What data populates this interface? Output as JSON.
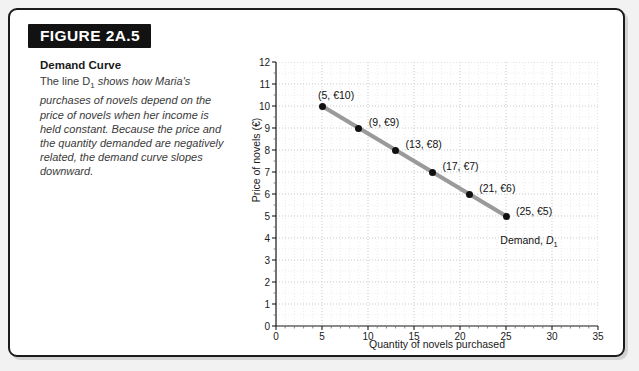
{
  "figure": {
    "number_label": "FIGURE 2A.5",
    "caption_title": "Demand Curve",
    "caption_line1": "The line D",
    "caption_sub": "1",
    "caption_line2": " shows how Maria's purchases of novels depend on the price of novels when her income is held constant. Because the price and the quantity demanded are negatively related, the demand curve slopes downward.",
    "banner_bg": "#121212",
    "banner_text_color": "#ffffff",
    "border_color": "#1b1b1b",
    "page_bg": "#f2f2f2"
  },
  "chart_data": {
    "type": "line",
    "title": "Demand Curve",
    "xlabel": "Quantity of novels purchased",
    "ylabel": "Price of novels (€)",
    "xlim": [
      0,
      35
    ],
    "ylim": [
      0,
      12
    ],
    "xticks": [
      0,
      5,
      10,
      15,
      20,
      25,
      30,
      35
    ],
    "yticks": [
      0,
      1,
      2,
      3,
      4,
      5,
      6,
      7,
      8,
      9,
      10,
      11,
      12
    ],
    "grid": true,
    "grid_minor_step_x": 1,
    "grid_minor_step_y": 0.5,
    "legend": "none",
    "series": [
      {
        "name": "Demand, D1",
        "line_color": "#9a9a9a",
        "marker_color": "#111111",
        "x": [
          5,
          9,
          13,
          17,
          21,
          25
        ],
        "values": [
          10,
          9,
          8,
          7,
          6,
          5
        ],
        "point_labels": [
          "(5, €10)",
          "(9, €9)",
          "(13, €8)",
          "(17, €7)",
          "(21, €6)",
          "(25, €5)"
        ]
      }
    ],
    "annotations": [
      {
        "text_prefix": "Demand, ",
        "text_var": "D",
        "text_sub": "1",
        "x": 27.5,
        "y": 4.2
      }
    ]
  }
}
